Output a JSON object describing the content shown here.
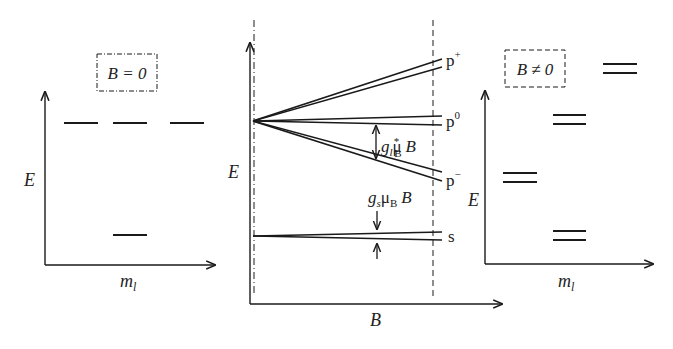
{
  "left_panel": {
    "box_label": "B = 0",
    "y_axis_label": "E",
    "x_axis_label_main": "m",
    "x_axis_label_sub": "l",
    "levels": [
      {
        "name": "p-level-1",
        "x1": 64,
        "x2": 98,
        "y": 123
      },
      {
        "name": "p-level-2",
        "x1": 113,
        "x2": 147,
        "y": 123
      },
      {
        "name": "p-level-3",
        "x1": 170,
        "x2": 204,
        "y": 123
      },
      {
        "name": "s-level",
        "x1": 113,
        "x2": 147,
        "y": 235
      }
    ]
  },
  "center_panel": {
    "y_axis_label": "E",
    "x_axis_label": "B",
    "state_labels": {
      "p_plus": "p",
      "p_plus_sup": "+",
      "p_zero": "p",
      "p_zero_sup": "0",
      "p_minus": "p",
      "p_minus_sup": "−",
      "s": "s"
    },
    "splitting_p": {
      "g": "g",
      "g_sub": "l",
      "mu": "μ",
      "mu_sub": "B",
      "mu_sup": "*",
      "B": "B"
    },
    "splitting_s": {
      "g": "g",
      "g_sub": "s",
      "mu": "μ",
      "mu_sub": "B",
      "B": "B"
    }
  },
  "right_panel": {
    "box_label": "B ≠ 0",
    "y_axis_label": "E",
    "x_axis_label_main": "m",
    "x_axis_label_sub": "l",
    "level_pairs": [
      {
        "name": "p-plus-pair",
        "x1": 603,
        "x2": 637,
        "y1": 64,
        "y2": 73
      },
      {
        "name": "p-zero-pair",
        "x1": 553,
        "x2": 586,
        "y1": 115,
        "y2": 124
      },
      {
        "name": "p-minus-pair",
        "x1": 503,
        "x2": 537,
        "y1": 173,
        "y2": 182
      },
      {
        "name": "s-pair",
        "x1": 553,
        "x2": 586,
        "y1": 231,
        "y2": 240
      }
    ]
  },
  "colors": {
    "line": "#1a1a1a",
    "text": "#222222",
    "background": "#ffffff"
  }
}
